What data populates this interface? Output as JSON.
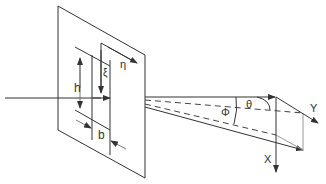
{
  "diagram": {
    "labels": {
      "h": "h",
      "b": "b",
      "xi": "ξ",
      "eta": "η",
      "theta": "θ",
      "phi": "Φ",
      "x_axis": "X",
      "y_axis": "Y"
    },
    "elements": [
      "incident-beam",
      "aperture-plane",
      "slit-plane-eta",
      "slit-opening",
      "diffracted-beam",
      "observation-axes"
    ],
    "colors": {
      "line": "#333333",
      "guide": "#999999",
      "background": "#ffffff"
    }
  }
}
